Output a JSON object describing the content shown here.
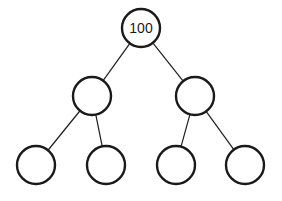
{
  "diagram": {
    "type": "binary-tree",
    "nodes": [
      {
        "id": "root",
        "label": "100",
        "cx": 141,
        "cy": 28,
        "r": 19
      },
      {
        "id": "left",
        "label": "",
        "cx": 92,
        "cy": 96,
        "r": 19
      },
      {
        "id": "right",
        "label": "",
        "cx": 195,
        "cy": 96,
        "r": 19
      },
      {
        "id": "left-left",
        "label": "",
        "cx": 36,
        "cy": 165,
        "r": 19
      },
      {
        "id": "left-right",
        "label": "",
        "cx": 106,
        "cy": 165,
        "r": 19
      },
      {
        "id": "right-left",
        "label": "",
        "cx": 176,
        "cy": 165,
        "r": 19
      },
      {
        "id": "right-right",
        "label": "",
        "cx": 245,
        "cy": 165,
        "r": 19
      }
    ],
    "edges": [
      [
        "root",
        "left"
      ],
      [
        "root",
        "right"
      ],
      [
        "left",
        "left-left"
      ],
      [
        "left",
        "left-right"
      ],
      [
        "right",
        "right-left"
      ],
      [
        "right",
        "right-right"
      ]
    ],
    "colors": {
      "stroke": "#1a1a1a",
      "background": "#ffffff"
    }
  }
}
